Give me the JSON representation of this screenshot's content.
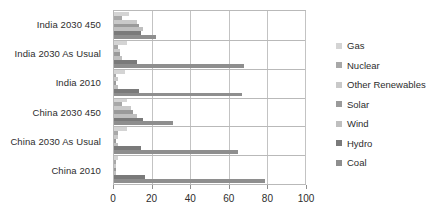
{
  "chart_data": {
    "type": "bar",
    "orientation": "horizontal",
    "title": "",
    "xlabel": "",
    "ylabel": "",
    "xlim": [
      0,
      100
    ],
    "xticks": [
      0,
      20,
      40,
      60,
      80,
      100
    ],
    "grid": true,
    "legend_position": "right",
    "categories": [
      "India 2030 450",
      "India 2030 As Usual",
      "India 2010",
      "China 2030 450",
      "China 2030 As Usual",
      "China 2010"
    ],
    "series": [
      {
        "name": "Gas",
        "color": "#d4d4d4",
        "values": [
          8,
          7,
          6,
          7,
          7,
          2
        ]
      },
      {
        "name": "Nuclear",
        "color": "#a8a8a8",
        "values": [
          4,
          2,
          1,
          4,
          2,
          1
        ]
      },
      {
        "name": "Other Renewables",
        "color": "#c9c9c9",
        "values": [
          12,
          3,
          2,
          9,
          2,
          1
        ]
      },
      {
        "name": "Solar",
        "color": "#9a9a9a",
        "values": [
          13,
          3,
          1,
          10,
          1,
          1
        ]
      },
      {
        "name": "Wind",
        "color": "#bfbfbf",
        "values": [
          15,
          4,
          2,
          12,
          2,
          1
        ]
      },
      {
        "name": "Hydro",
        "color": "#7a7a7a",
        "values": [
          14,
          12,
          13,
          15,
          14,
          16
        ]
      },
      {
        "name": "Coal",
        "color": "#8e8e8e",
        "values": [
          22,
          68,
          67,
          31,
          65,
          79
        ]
      }
    ]
  },
  "legend": {
    "items": [
      {
        "label": "Gas"
      },
      {
        "label": "Nuclear"
      },
      {
        "label": "Other Renewables"
      },
      {
        "label": "Solar"
      },
      {
        "label": "Wind"
      },
      {
        "label": "Hydro"
      },
      {
        "label": "Coal"
      }
    ]
  }
}
